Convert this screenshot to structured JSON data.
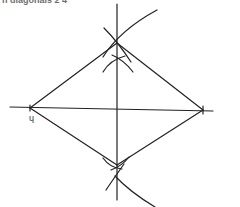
{
  "header": {
    "title": "n diagonals 2  4",
    "subtitle": "constructing a rhombus"
  },
  "diagram": {
    "type": "geometric-construction",
    "stroke_color": "#222222",
    "vertices": {
      "left": [
        30,
        108
      ],
      "top": [
        117,
        43
      ],
      "right": [
        203,
        110
      ],
      "bottom": [
        117,
        165
      ]
    },
    "axis_horizontal": {
      "from": [
        10,
        107
      ],
      "to": [
        213,
        111
      ]
    },
    "axis_vertical": {
      "from": [
        117,
        4
      ],
      "to": [
        117,
        200
      ]
    },
    "mark_label": "ɥ"
  }
}
